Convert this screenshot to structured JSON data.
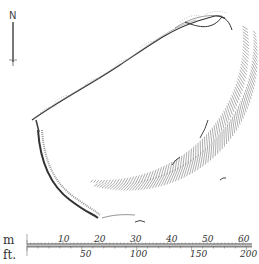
{
  "north_arrow": {
    "label": "N"
  },
  "scale": {
    "unit_top": "m",
    "unit_bottom": "ft.",
    "metres": [
      {
        "label": "10",
        "x": 58
      },
      {
        "label": "20",
        "x": 94
      },
      {
        "label": "30",
        "x": 130
      },
      {
        "label": "40",
        "x": 166
      },
      {
        "label": "50",
        "x": 202
      },
      {
        "label": "60",
        "x": 238
      }
    ],
    "feet": [
      {
        "label": "50",
        "x": 80
      },
      {
        "label": "100",
        "x": 130
      },
      {
        "label": "150",
        "x": 190
      },
      {
        "label": "200",
        "x": 240
      }
    ]
  },
  "colors": {
    "ink": "#333333",
    "hatch": "#777777",
    "background": "#ffffff"
  }
}
